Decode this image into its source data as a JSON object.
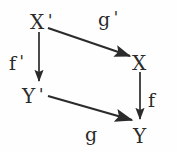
{
  "figure": {
    "kind": "commutative-diagram",
    "background_color": "#fefefe",
    "ink_color": "#2b2b2b",
    "width": 177,
    "height": 153
  },
  "vertices": [
    {
      "id": "x-prime",
      "base": "X",
      "prime": "'",
      "position": "top-left"
    },
    {
      "id": "x",
      "base": "X",
      "prime": "",
      "position": "middle-right"
    },
    {
      "id": "y-prime",
      "base": "Y",
      "prime": "'",
      "position": "middle-left"
    },
    {
      "id": "y",
      "base": "Y",
      "prime": "",
      "position": "bottom-right"
    }
  ],
  "morphisms": [
    {
      "id": "f-prime",
      "base": "f",
      "prime": "'",
      "source": "X'",
      "target": "Y'",
      "style": "vertical-down",
      "from": [
        39,
        32
      ],
      "to": [
        39,
        82
      ]
    },
    {
      "id": "g-prime",
      "base": "g",
      "prime": "'",
      "source": "X'",
      "target": "X",
      "style": "diagonal-down-right",
      "from": [
        47,
        28
      ],
      "to": [
        131,
        57
      ]
    },
    {
      "id": "f",
      "base": "f",
      "prime": "",
      "source": "X",
      "target": "Y",
      "style": "vertical-down",
      "from": [
        140,
        72
      ],
      "to": [
        140,
        120
      ]
    },
    {
      "id": "g",
      "base": "g",
      "prime": "",
      "source": "Y'",
      "target": "Y",
      "style": "diagonal-down-right",
      "from": [
        48,
        96
      ],
      "to": [
        133,
        121
      ]
    }
  ]
}
